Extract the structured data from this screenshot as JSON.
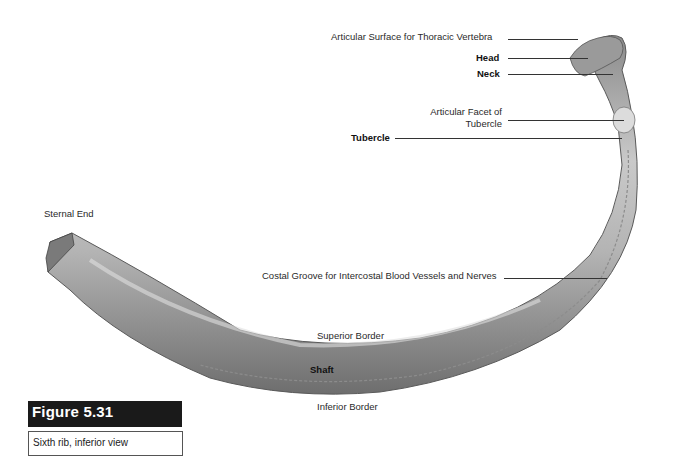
{
  "figure": {
    "number": "Figure 5.31",
    "caption": "Sixth rib, inferior view",
    "accent_color": "#1a1a1a"
  },
  "labels": {
    "articular_surface": "Articular Surface for Thoracic Vertebra",
    "head": "Head",
    "neck": "Neck",
    "articular_facet_line1": "Articular Facet of",
    "articular_facet_line2": "Tubercle",
    "tubercle": "Tubercle",
    "sternal_end": "Sternal End",
    "costal_groove": "Costal Groove for Intercostal Blood Vessels and Nerves",
    "superior_border": "Superior Border",
    "shaft": "Shaft",
    "inferior_border": "Inferior Border"
  }
}
